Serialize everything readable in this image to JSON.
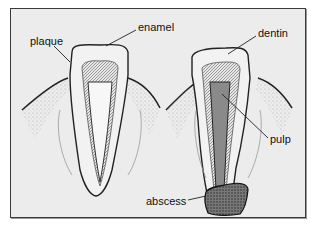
{
  "figure": {
    "background_color": "#ececec",
    "border_color": "#3a3a3a",
    "labels": {
      "plaque": "plaque",
      "enamel": "enamel",
      "dentin": "dentin",
      "pulp": "pulp",
      "abscess": "abscess"
    },
    "teeth": [
      {
        "name": "healthy-tooth-with-plaque",
        "labels": [
          "plaque",
          "enamel"
        ]
      },
      {
        "name": "decayed-tooth-with-abscess",
        "labels": [
          "dentin",
          "pulp",
          "abscess"
        ]
      }
    ]
  }
}
